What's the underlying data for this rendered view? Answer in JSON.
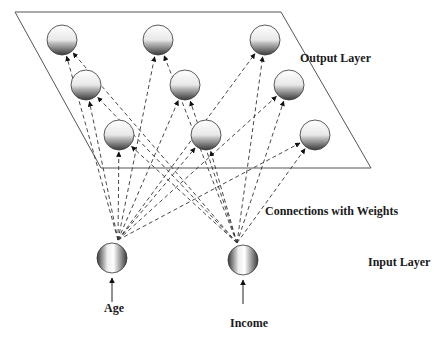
{
  "labels": {
    "output_layer": "Output Layer",
    "connections": "Connections with Weights",
    "input_layer": "Input Layer"
  },
  "inputs": [
    {
      "id": "age",
      "label": "Age"
    },
    {
      "id": "income",
      "label": "Income"
    }
  ],
  "output_nodes": [
    {
      "row": 1,
      "col": 1
    },
    {
      "row": 1,
      "col": 2
    },
    {
      "row": 1,
      "col": 3
    },
    {
      "row": 2,
      "col": 1
    },
    {
      "row": 2,
      "col": 2
    },
    {
      "row": 2,
      "col": 3
    },
    {
      "row": 3,
      "col": 1
    },
    {
      "row": 3,
      "col": 2
    },
    {
      "row": 3,
      "col": 3
    }
  ],
  "connections": "every input connects to every output node (dashed arrows)"
}
